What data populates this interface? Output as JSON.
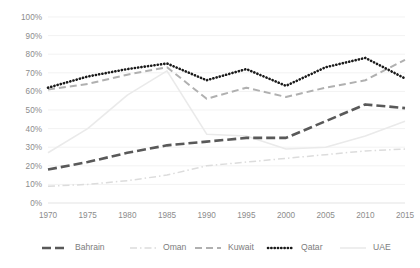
{
  "chart_data": {
    "type": "line",
    "title": "",
    "subtitle": "",
    "xlabel": "",
    "ylabel": "",
    "xlim": [
      1970,
      2015
    ],
    "ylim": [
      0,
      100
    ],
    "grid": true,
    "legend_position": "bottom",
    "x": [
      1970,
      1975,
      1980,
      1985,
      1990,
      1995,
      2000,
      2005,
      2010,
      2015
    ],
    "xtick_labels": [
      "1970",
      "1975",
      "1980",
      "1985",
      "1990",
      "1995",
      "2000",
      "2005",
      "2010",
      "2015"
    ],
    "ytick_values": [
      0,
      10,
      20,
      30,
      40,
      50,
      60,
      70,
      80,
      90,
      100
    ],
    "ytick_labels": [
      "0%",
      "10%",
      "20%",
      "30%",
      "40%",
      "50%",
      "60%",
      "70%",
      "80%",
      "90%",
      "100%"
    ],
    "series": [
      {
        "name": "Bahrain",
        "color": "#595959",
        "style": "dashed-thick",
        "dasharray": "9,4",
        "width": 2.6,
        "values": [
          18,
          22,
          27,
          31,
          33,
          35,
          35,
          44,
          53,
          51
        ]
      },
      {
        "name": "Oman",
        "color": "#dcdcdc",
        "style": "dash-dot",
        "dasharray": "7,3,1.5,3",
        "width": 1.5,
        "values": [
          9,
          10,
          12,
          15,
          20,
          22,
          24,
          26,
          28,
          29
        ]
      },
      {
        "name": "Kuwait",
        "color": "#b0b0b0",
        "style": "dashed",
        "dasharray": "7,4",
        "width": 2.0,
        "values": [
          61,
          64,
          69,
          73,
          56,
          62,
          57,
          62,
          66,
          77
        ]
      },
      {
        "name": "Qatar",
        "color": "#1a1a1a",
        "style": "dotted",
        "dasharray": "0.2,3.1",
        "width": 2.6,
        "values": [
          62,
          68,
          72,
          75,
          66,
          72,
          63,
          73,
          78,
          67
        ]
      },
      {
        "name": "UAE",
        "color": "#eaeaea",
        "style": "solid-light",
        "dasharray": "none",
        "width": 1.6,
        "values": [
          27,
          40,
          58,
          71,
          37,
          36,
          29,
          30,
          36,
          44
        ]
      }
    ]
  },
  "legend": {
    "items": [
      {
        "label": "Bahrain",
        "key": "legend-marker-bahrain"
      },
      {
        "label": "Oman",
        "key": "legend-marker-oman"
      },
      {
        "label": "Kuwait",
        "key": "legend-marker-kuwait"
      },
      {
        "label": "Qatar",
        "key": "legend-marker-qatar"
      },
      {
        "label": "UAE",
        "key": "legend-marker-uae"
      }
    ]
  },
  "colors": {
    "background": "#ffffff",
    "gridline": "#ededed",
    "tick_text": "#8c8c8c",
    "legend_text": "#7d7d7d"
  }
}
